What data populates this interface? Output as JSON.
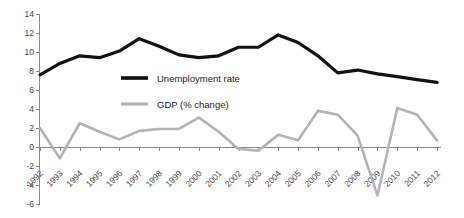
{
  "chart_data": {
    "type": "line",
    "title": "",
    "subtitle": "",
    "xlabel": "",
    "ylabel": "",
    "ylim": [
      -6,
      14
    ],
    "ytick_step": 2,
    "yticks": [
      "14",
      "12",
      "10",
      "8",
      "6",
      "4",
      "2",
      "0",
      "-2",
      "-4",
      "-6"
    ],
    "grid": false,
    "legend_position": "inside-upper-left",
    "zero_line": true,
    "categories": [
      "1992",
      "1993",
      "1994",
      "1995",
      "1996",
      "1997",
      "1998",
      "1999",
      "2000",
      "2001",
      "2002",
      "2003",
      "2004",
      "2005",
      "2006",
      "2007",
      "2008",
      "2009",
      "2010",
      "2011",
      "2012"
    ],
    "series": [
      {
        "name": "Unemployment rate",
        "color": "#111111",
        "values": [
          7.6,
          8.8,
          9.6,
          9.4,
          10.1,
          11.4,
          10.6,
          9.7,
          9.4,
          9.6,
          10.5,
          10.5,
          11.8,
          11.0,
          9.6,
          7.8,
          8.1,
          7.7,
          7.4,
          7.1,
          6.8
        ]
      },
      {
        "name": "GDP (% change)",
        "color": "#b3b3b3",
        "values": [
          2.0,
          -1.2,
          2.5,
          1.6,
          0.8,
          1.7,
          1.9,
          1.9,
          3.1,
          1.6,
          -0.2,
          -0.4,
          1.3,
          0.7,
          3.8,
          3.4,
          1.2,
          -5.1,
          4.1,
          3.4,
          0.7
        ]
      }
    ]
  },
  "legend": {
    "items": [
      {
        "label": "Unemployment rate",
        "color": "#111111"
      },
      {
        "label": "GDP (% change)",
        "color": "#b3b3b3"
      }
    ]
  },
  "axes": {
    "y_axis_name": "value-axis",
    "x_axis_name": "year-axis"
  }
}
